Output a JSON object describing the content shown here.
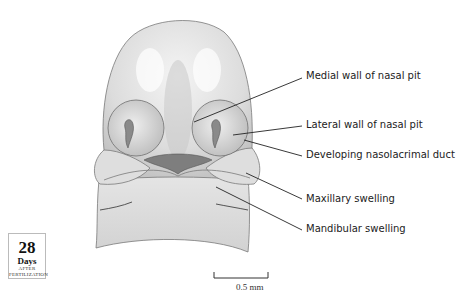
{
  "figure": {
    "labels": [
      {
        "id": "medial-wall",
        "text": "Medial wall of nasal pit"
      },
      {
        "id": "lateral-wall",
        "text": "Lateral wall of nasal pit"
      },
      {
        "id": "nasolacrimal-duct",
        "text": "Developing nasolacrimal duct"
      },
      {
        "id": "maxillary",
        "text": "Maxillary swelling"
      },
      {
        "id": "mandibular",
        "text": "Mandibular swelling"
      }
    ],
    "age_badge": {
      "number": "28",
      "unit": "Days",
      "caption": "AFTER FERTILIZATION"
    },
    "scale_bar": {
      "label": "0.5 mm"
    },
    "colors": {
      "tissue_light": "#ececec",
      "tissue_mid": "#cfcfcf",
      "tissue_dark": "#8a8a8a",
      "outline": "#6e6e6e",
      "leader_line": "#222222"
    }
  }
}
